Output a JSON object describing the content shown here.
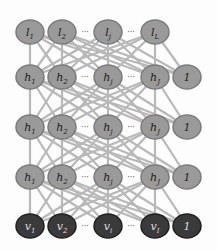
{
  "diagram": {
    "type": "neural-network",
    "colors": {
      "edge": "#b8b8b8",
      "hidden_fill": "#9a9a9a",
      "hidden_stroke": "#7a7a7a",
      "input_fill": "#3a3a3a",
      "input_stroke": "#1f1f1f",
      "label_dark": "#222222",
      "label_light": "#dddddd",
      "ellipsis": "#555555"
    },
    "layers": [
      {
        "name": "output",
        "y": 32,
        "style": "hidden",
        "nodes": [
          {
            "label": "l",
            "sub": "1",
            "x": 30
          },
          {
            "label": "l",
            "sub": "2",
            "x": 62
          },
          {
            "label": "l",
            "sub": "j",
            "x": 108
          },
          {
            "label": "l",
            "sub": "L",
            "x": 155
          }
        ],
        "ellipses": [
          {
            "x": 85
          },
          {
            "x": 131
          }
        ]
      },
      {
        "name": "hidden-3",
        "y": 77,
        "style": "hidden",
        "nodes": [
          {
            "label": "h",
            "sub": "1",
            "x": 30
          },
          {
            "label": "h",
            "sub": "2",
            "x": 62
          },
          {
            "label": "h",
            "sub": "j",
            "x": 108
          },
          {
            "label": "h",
            "sub": "J",
            "x": 155
          },
          {
            "label": "1",
            "sub": "",
            "x": 187,
            "bias": true
          }
        ],
        "ellipses": [
          {
            "x": 85
          },
          {
            "x": 131
          }
        ]
      },
      {
        "name": "hidden-2",
        "y": 127,
        "style": "hidden",
        "nodes": [
          {
            "label": "h",
            "sub": "1",
            "x": 30
          },
          {
            "label": "h",
            "sub": "2",
            "x": 62
          },
          {
            "label": "h",
            "sub": "j",
            "x": 108
          },
          {
            "label": "h",
            "sub": "J",
            "x": 155
          },
          {
            "label": "1",
            "sub": "",
            "x": 187,
            "bias": true
          }
        ],
        "ellipses": [
          {
            "x": 85
          },
          {
            "x": 131
          }
        ]
      },
      {
        "name": "hidden-1",
        "y": 177,
        "style": "hidden",
        "nodes": [
          {
            "label": "h",
            "sub": "1",
            "x": 30
          },
          {
            "label": "h",
            "sub": "2",
            "x": 62
          },
          {
            "label": "h",
            "sub": "j",
            "x": 108
          },
          {
            "label": "h",
            "sub": "J",
            "x": 155
          },
          {
            "label": "1",
            "sub": "",
            "x": 187,
            "bias": true
          }
        ],
        "ellipses": [
          {
            "x": 85
          },
          {
            "x": 131
          }
        ]
      },
      {
        "name": "input",
        "y": 226,
        "style": "input",
        "nodes": [
          {
            "label": "v",
            "sub": "1",
            "x": 30
          },
          {
            "label": "v",
            "sub": "2",
            "x": 62
          },
          {
            "label": "v",
            "sub": "i",
            "x": 108
          },
          {
            "label": "v",
            "sub": "I",
            "x": 155
          },
          {
            "label": "1",
            "sub": "",
            "x": 187,
            "bias": true
          }
        ],
        "ellipses": [
          {
            "x": 85
          },
          {
            "x": 131
          }
        ]
      }
    ],
    "ellipsis_text": "···",
    "node_rx": 14,
    "node_ry": 12
  }
}
